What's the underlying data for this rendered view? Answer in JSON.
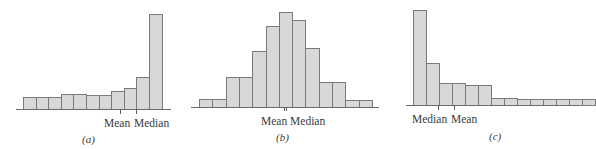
{
  "chart_data": [
    {
      "type": "bar",
      "title": "",
      "caption": "(a)",
      "xlabel": "",
      "ylabel": "",
      "grid": false,
      "shape": "left-skewed",
      "categories": [
        "1",
        "2",
        "3",
        "4",
        "5",
        "6",
        "7",
        "8",
        "9",
        "10",
        "11"
      ],
      "values": [
        12,
        12,
        12,
        15,
        15,
        14,
        14,
        18,
        21,
        32,
        95
      ],
      "annotations": [
        {
          "label": "Mean",
          "x_px": 120
        },
        {
          "label": "Median",
          "x_px": 136
        }
      ],
      "layout": {
        "left": 23,
        "bar_width": 12.6,
        "baseline": 109,
        "axis_start": 16,
        "axis_end": 171
      }
    },
    {
      "type": "bar",
      "title": "",
      "caption": "(b)",
      "xlabel": "",
      "ylabel": "",
      "grid": false,
      "shape": "symmetric",
      "categories": [
        "1",
        "2",
        "3",
        "4",
        "5",
        "6",
        "7",
        "8",
        "9",
        "10",
        "11",
        "12",
        "13"
      ],
      "values": [
        8,
        8,
        30,
        30,
        56,
        81,
        95,
        87,
        59,
        25,
        25,
        7,
        7
      ],
      "annotations": [
        {
          "label": "Mean",
          "x_px": 284
        },
        {
          "label": "Median",
          "x_px": 286
        }
      ],
      "layout": {
        "left": 199,
        "bar_width": 13.3,
        "baseline": 107,
        "axis_start": 191,
        "axis_end": 379
      }
    },
    {
      "type": "bar",
      "title": "",
      "caption": "(c)",
      "xlabel": "",
      "ylabel": "",
      "grid": false,
      "shape": "right-skewed",
      "categories": [
        "1",
        "2",
        "3",
        "4",
        "5",
        "6",
        "7",
        "8",
        "9",
        "10",
        "11",
        "12",
        "13",
        "14"
      ],
      "values": [
        95,
        42,
        22,
        22,
        20,
        20,
        7,
        7,
        6,
        6,
        6,
        6,
        6,
        6
      ],
      "annotations": [
        {
          "label": "Median",
          "x_px": 438
        },
        {
          "label": "Mean",
          "x_px": 454
        }
      ],
      "layout": {
        "left": 413,
        "bar_width": 13.0,
        "baseline": 105,
        "axis_start": 406,
        "axis_end": 579
      }
    }
  ],
  "panels": {
    "a": {
      "caption": "(a)",
      "label_mean": "Mean",
      "label_median": "Median"
    },
    "b": {
      "caption": "(b)",
      "label_mean_median": "Mean Median"
    },
    "c": {
      "caption": "(c)",
      "label_median": "Median",
      "label_mean": "Mean"
    }
  },
  "colors": {
    "bar_fill": "#d8d8d8",
    "bar_stroke": "#7a7a7a",
    "axis": "#6a6a6a",
    "text": "#3a3a3a"
  }
}
